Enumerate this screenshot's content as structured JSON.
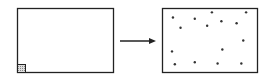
{
  "diagram": {
    "left_panel": {
      "content": "shaded-square-corner"
    },
    "arrow": {
      "direction": "right"
    },
    "right_panel": {
      "content": "scattered-dots",
      "dot_count": 15,
      "dots": [
        [
          0.11,
          0.14
        ],
        [
          0.34,
          0.16
        ],
        [
          0.52,
          0.06
        ],
        [
          0.88,
          0.06
        ],
        [
          0.19,
          0.3
        ],
        [
          0.47,
          0.27
        ],
        [
          0.62,
          0.2
        ],
        [
          0.78,
          0.23
        ],
        [
          0.85,
          0.5
        ],
        [
          0.1,
          0.67
        ],
        [
          0.63,
          0.64
        ],
        [
          0.13,
          0.87
        ],
        [
          0.34,
          0.84
        ],
        [
          0.58,
          0.86
        ],
        [
          0.83,
          0.86
        ]
      ]
    },
    "colors": {
      "stroke": "#222222",
      "shade": "#999999",
      "dot": "#333333"
    }
  }
}
